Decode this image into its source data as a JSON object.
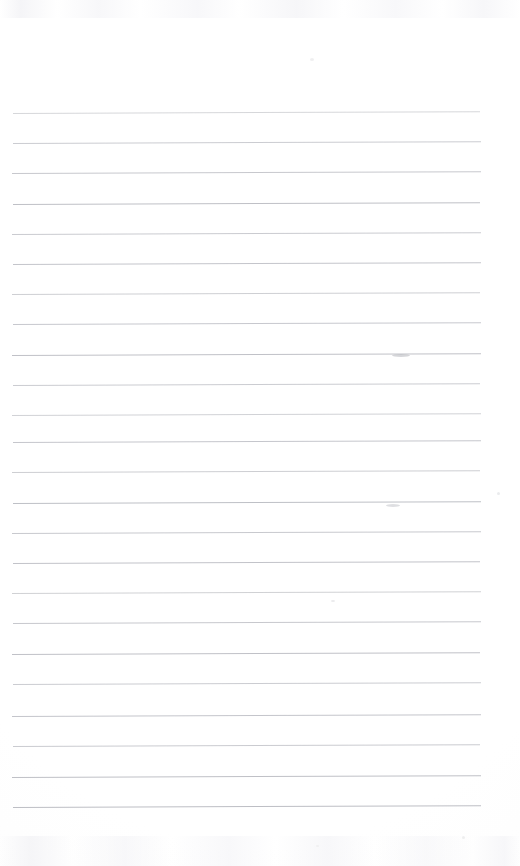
{
  "document": {
    "kind": "scanned-lined-paper",
    "title": "Blank Ruled Notepad Page",
    "page_width_px": 520,
    "page_height_px": 866,
    "background_color": "#ffffff",
    "paper_tint_color": "#fdfdfd",
    "has_text_content": false,
    "visible_text": ""
  },
  "ruling": {
    "line_color": "#c9cace",
    "line_color_light": "#d8d9dd",
    "line_color_dark": "#b9bac0",
    "line_count": 24,
    "first_line_y": 113,
    "line_spacing_px": 30.2,
    "last_line_y": 807,
    "line_left_x": 12,
    "line_right_x": 481,
    "line_thickness_px": 1,
    "skew_deg": -0.22,
    "lines": [
      {
        "index": 1,
        "y": 113,
        "x1": 13,
        "x2": 480,
        "color": "#cfd0d4",
        "opacity": 0.85
      },
      {
        "index": 2,
        "y": 143,
        "x1": 13,
        "x2": 481,
        "color": "#c7c8cd",
        "opacity": 0.92
      },
      {
        "index": 3,
        "y": 173,
        "x1": 12,
        "x2": 481,
        "color": "#c4c5ca",
        "opacity": 0.95
      },
      {
        "index": 4,
        "y": 204,
        "x1": 13,
        "x2": 480,
        "color": "#bfc0c6",
        "opacity": 1.0
      },
      {
        "index": 5,
        "y": 234,
        "x1": 12,
        "x2": 481,
        "color": "#c6c7cc",
        "opacity": 0.93
      },
      {
        "index": 6,
        "y": 264,
        "x1": 13,
        "x2": 481,
        "color": "#c2c3c9",
        "opacity": 0.97
      },
      {
        "index": 7,
        "y": 294,
        "x1": 12,
        "x2": 480,
        "color": "#c9cace",
        "opacity": 0.9
      },
      {
        "index": 8,
        "y": 324,
        "x1": 13,
        "x2": 481,
        "color": "#c4c5cb",
        "opacity": 0.95
      },
      {
        "index": 9,
        "y": 355,
        "x1": 12,
        "x2": 481,
        "color": "#c0c1c7",
        "opacity": 1.0
      },
      {
        "index": 10,
        "y": 385,
        "x1": 13,
        "x2": 480,
        "color": "#c7c8cd",
        "opacity": 0.92
      },
      {
        "index": 11,
        "y": 415,
        "x1": 12,
        "x2": 481,
        "color": "#cbccd0",
        "opacity": 0.88
      },
      {
        "index": 12,
        "y": 442,
        "x1": 13,
        "x2": 481,
        "color": "#c3c4ca",
        "opacity": 0.96
      },
      {
        "index": 13,
        "y": 472,
        "x1": 12,
        "x2": 480,
        "color": "#c8c9ce",
        "opacity": 0.91
      },
      {
        "index": 14,
        "y": 503,
        "x1": 13,
        "x2": 481,
        "color": "#bec0c6",
        "opacity": 1.0
      },
      {
        "index": 15,
        "y": 533,
        "x1": 12,
        "x2": 481,
        "color": "#c5c6cb",
        "opacity": 0.94
      },
      {
        "index": 16,
        "y": 563,
        "x1": 13,
        "x2": 480,
        "color": "#c1c2c8",
        "opacity": 0.98
      },
      {
        "index": 17,
        "y": 593,
        "x1": 12,
        "x2": 481,
        "color": "#cacbcf",
        "opacity": 0.89
      },
      {
        "index": 18,
        "y": 623,
        "x1": 13,
        "x2": 481,
        "color": "#c4c5ca",
        "opacity": 0.95
      },
      {
        "index": 19,
        "y": 654,
        "x1": 12,
        "x2": 480,
        "color": "#c0c1c7",
        "opacity": 1.0
      },
      {
        "index": 20,
        "y": 684,
        "x1": 13,
        "x2": 481,
        "color": "#c7c8cd",
        "opacity": 0.92
      },
      {
        "index": 21,
        "y": 716,
        "x1": 12,
        "x2": 481,
        "color": "#c2c3c9",
        "opacity": 0.97
      },
      {
        "index": 22,
        "y": 746,
        "x1": 13,
        "x2": 480,
        "color": "#c6c7cc",
        "opacity": 0.93
      },
      {
        "index": 23,
        "y": 777,
        "x1": 12,
        "x2": 481,
        "color": "#bfc0c6",
        "opacity": 1.0
      },
      {
        "index": 24,
        "y": 807,
        "x1": 13,
        "x2": 481,
        "color": "#bdbec4",
        "opacity": 1.0
      }
    ]
  },
  "margins": {
    "top_blank_px": 113,
    "bottom_blank_px": 59,
    "left_px": 12,
    "right_px": 39
  },
  "blemishes": [
    {
      "name": "smudge-upper-right",
      "x": 392,
      "y": 354,
      "w": 18,
      "h": 3,
      "color": "#b4b5bb",
      "opacity": 0.55
    },
    {
      "name": "smudge-mid-right",
      "x": 386,
      "y": 504,
      "w": 14,
      "h": 3,
      "color": "#b8b9bf",
      "opacity": 0.45
    },
    {
      "name": "speck-right-margin",
      "x": 497,
      "y": 492,
      "w": 3,
      "h": 3,
      "color": "#e2e3e6",
      "opacity": 0.7
    },
    {
      "name": "speck-lower-right",
      "x": 331,
      "y": 600,
      "w": 4,
      "h": 2,
      "color": "#dcdde0",
      "opacity": 0.6
    },
    {
      "name": "speck-top-center",
      "x": 310,
      "y": 58,
      "w": 4,
      "h": 3,
      "color": "#ececed",
      "opacity": 0.8
    },
    {
      "name": "speck-bottom-right",
      "x": 462,
      "y": 836,
      "w": 3,
      "h": 3,
      "color": "#e8e9ea",
      "opacity": 0.7
    },
    {
      "name": "speck-bottom-mid",
      "x": 316,
      "y": 845,
      "w": 3,
      "h": 2,
      "color": "#ebebec",
      "opacity": 0.65
    }
  ]
}
